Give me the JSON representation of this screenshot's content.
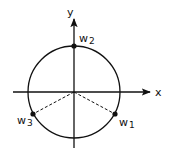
{
  "diagram": {
    "title": "",
    "axes": {
      "x_label": "x",
      "y_label": "y"
    },
    "circle": {
      "center": [
        74,
        92
      ],
      "radius": 46
    },
    "points": [
      {
        "name": "w",
        "subscript": "1",
        "pos": [
          115,
          114
        ]
      },
      {
        "name": "w",
        "subscript": "2",
        "pos": [
          74,
          46
        ]
      },
      {
        "name": "w",
        "subscript": "3",
        "pos": [
          33,
          114
        ]
      }
    ],
    "colors": {
      "stroke": "#111111",
      "background": "#ffffff"
    }
  }
}
